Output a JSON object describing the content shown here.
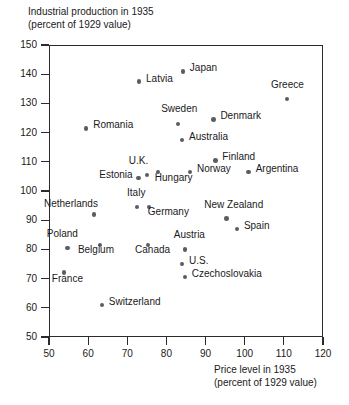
{
  "chart_data": {
    "type": "scatter",
    "title": "",
    "ylabel": "Industrial production in 1935\n(percent of 1929 value)",
    "xlabel": "Price level in 1935\n(percent of 1929 value)",
    "xlim": [
      50,
      120
    ],
    "ylim": [
      50,
      150
    ],
    "xticks": [
      50,
      60,
      70,
      80,
      90,
      100,
      110,
      120
    ],
    "yticks": [
      50,
      60,
      70,
      80,
      90,
      100,
      110,
      120,
      130,
      140,
      150
    ],
    "grid": false,
    "legend": "none",
    "marker_color": "#5c5c66",
    "axis_color": "#2b2b2b",
    "points": [
      {
        "label": "Japan",
        "x": 84.2,
        "y": 141.0,
        "lx": 7,
        "ly": -4
      },
      {
        "label": "Latvia",
        "x": 73.0,
        "y": 137.5,
        "lx": 7,
        "ly": -4
      },
      {
        "label": "Greece",
        "x": 110.8,
        "y": 131.5,
        "lx": -16,
        "ly": -15
      },
      {
        "label": "Denmark",
        "x": 92.0,
        "y": 124.5,
        "lx": 7,
        "ly": -4
      },
      {
        "label": "Sweden",
        "x": 83.0,
        "y": 123.0,
        "lx": -17,
        "ly": -16
      },
      {
        "label": "Romania",
        "x": 59.5,
        "y": 121.5,
        "lx": 7,
        "ly": -4
      },
      {
        "label": "Australia",
        "x": 84.0,
        "y": 117.5,
        "lx": 7,
        "ly": -4
      },
      {
        "label": "Finland",
        "x": 92.5,
        "y": 110.5,
        "lx": 7,
        "ly": -4
      },
      {
        "label": "Argentina",
        "x": 101.0,
        "y": 106.5,
        "lx": 7,
        "ly": -4
      },
      {
        "label": "Norway",
        "x": 86.0,
        "y": 106.5,
        "lx": 7,
        "ly": -4
      },
      {
        "label": "Hungary",
        "x": 77.8,
        "y": 106.5,
        "lx": -3,
        "ly": 5
      },
      {
        "label": "U.K.",
        "x": 75.0,
        "y": 105.5,
        "lx": -18,
        "ly": -15
      },
      {
        "label": "Estonia",
        "x": 72.8,
        "y": 104.5,
        "lx": -39,
        "ly": -4
      },
      {
        "label": "Germany",
        "x": 75.5,
        "y": 94.5,
        "lx": -1,
        "ly": 4
      },
      {
        "label": "Italy",
        "x": 72.5,
        "y": 94.5,
        "lx": -10,
        "ly": -15
      },
      {
        "label": "New Zealand",
        "x": 95.3,
        "y": 90.5,
        "lx": -22,
        "ly": -15
      },
      {
        "label": "Netherlands",
        "x": 61.5,
        "y": 92.0,
        "lx": -50,
        "ly": -11
      },
      {
        "label": "Spain",
        "x": 98.0,
        "y": 87.0,
        "lx": 7,
        "ly": -4
      },
      {
        "label": "Canada",
        "x": 75.3,
        "y": 81.5,
        "lx": -13,
        "ly": 4
      },
      {
        "label": "Austria",
        "x": 84.7,
        "y": 80.0,
        "lx": -11,
        "ly": -15
      },
      {
        "label": "Belgium",
        "x": 63.0,
        "y": 81.5,
        "lx": -22,
        "ly": 4
      },
      {
        "label": "Poland",
        "x": 54.8,
        "y": 80.5,
        "lx": -21,
        "ly": -15
      },
      {
        "label": "U.S.",
        "x": 84.0,
        "y": 75.0,
        "lx": 7,
        "ly": -4
      },
      {
        "label": "France",
        "x": 53.8,
        "y": 72.0,
        "lx": -12,
        "ly": 5
      },
      {
        "label": "Czechoslovakia",
        "x": 84.7,
        "y": 70.5,
        "lx": 7,
        "ly": -4
      },
      {
        "label": "Switzerland",
        "x": 63.5,
        "y": 61.0,
        "lx": 7,
        "ly": -4
      }
    ]
  }
}
